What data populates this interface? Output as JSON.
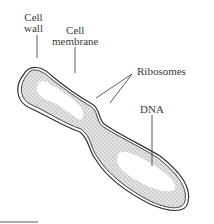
{
  "diagram": {
    "labels": {
      "cell_wall_line1": "Cell",
      "cell_wall_line2": "wall",
      "cell_membrane_line1": "Cell",
      "cell_membrane_line2": "membrane",
      "ribosomes": "Ribosomes",
      "dna": "DNA"
    },
    "colors": {
      "outline": "#333333",
      "cytoplasm": "#d4d4d4",
      "nucleoid": "#ffffff",
      "text": "#3a3a3a"
    }
  }
}
